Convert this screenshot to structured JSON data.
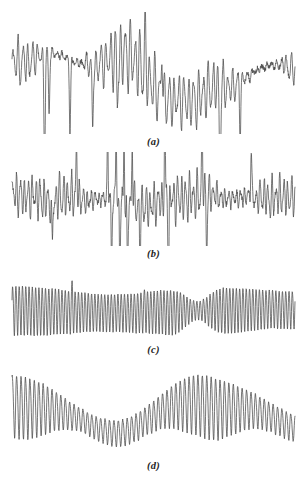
{
  "figure": {
    "kind": "multi-panel-signal-traces",
    "background_color": "#ffffff",
    "trace_color": "#4a4a4a",
    "label_color": "#242424",
    "panel_count": 4
  },
  "panels": [
    {
      "label": "(a)",
      "name": "panel-a",
      "description": "Irregular oscillatory trace with slowly drifting baseline, several deep downward spikes near the left and a high-amplitude burst in the right-of-centre region.",
      "x_range": [
        0,
        1
      ],
      "y_range": [
        -1,
        1
      ],
      "box": {
        "top": 12,
        "height": 122,
        "label_top": 136
      }
    },
    {
      "label": "(b)",
      "name": "panel-b",
      "description": "Dense noisy oscillation with flat baseline and a cluster of very tall narrow spikes near the centre.",
      "x_range": [
        0,
        1
      ],
      "y_range": [
        -1,
        1
      ],
      "box": {
        "top": 152,
        "height": 94,
        "label_top": 248
      }
    },
    {
      "label": "(c)",
      "name": "panel-c",
      "description": "Highly periodic sawtooth-like oscillation of nearly constant frequency with a pronounced amplitude dip in the right-of-centre region.",
      "x_range": [
        0,
        1
      ],
      "y_range": [
        -1,
        1
      ],
      "box": {
        "top": 278,
        "height": 64,
        "label_top": 344
      }
    },
    {
      "label": "(d)",
      "name": "panel-d",
      "description": "Amplitude-modulated oscillation with a smoothly undulating baseline producing two raised lobes and an intervening low-amplitude trough.",
      "x_range": [
        0,
        1
      ],
      "y_range": [
        -1,
        1
      ],
      "box": {
        "top": 372,
        "height": 86,
        "label_top": 460
      }
    }
  ],
  "chart_data": {
    "type": "line",
    "title": "",
    "xlabel": "",
    "ylabel": "",
    "grid": false,
    "legend": "none",
    "axes_visible": false,
    "panel_labels": [
      "(a)",
      "(b)",
      "(c)",
      "(d)"
    ],
    "series": [
      {
        "name": "(a)",
        "n_points": 1100,
        "sampling": "uniform",
        "xlim": [
          0,
          1
        ],
        "ylim": [
          -1,
          1
        ],
        "generator": {
          "baseline": [
            {
              "amp": 0.3,
              "freq": 1.0,
              "phase": 0.55
            },
            {
              "amp": 0.16,
              "freq": 2.3,
              "phase": 2.1
            },
            {
              "amp": 0.09,
              "freq": 3.7,
              "phase": 4.4
            }
          ],
          "envelope": [
            {
              "amp": 0.26,
              "freq": 1.4,
              "phase": 3.3
            },
            {
              "amp": 0.14,
              "freq": 2.9,
              "phase": 0.9
            }
          ],
          "envelope_base": 0.42,
          "carrier": [
            {
              "amp": 1.0,
              "freq": 58.0,
              "phase": 0.0
            },
            {
              "amp": 0.34,
              "freq": 91.0,
              "phase": 1.7
            },
            {
              "amp": 0.2,
              "freq": 37.0,
              "phase": 3.9
            }
          ],
          "noise_amp": 0.11,
          "seed": 20114,
          "spikes": [
            {
              "x": 0.115,
              "depth": -1.55,
              "width": 0.0035
            },
            {
              "x": 0.131,
              "depth": -0.95,
              "width": 0.003
            },
            {
              "x": 0.205,
              "depth": -1.2,
              "width": 0.0032
            },
            {
              "x": 0.285,
              "depth": -1.05,
              "width": 0.003
            },
            {
              "x": 0.372,
              "depth": -0.8,
              "width": 0.0028
            },
            {
              "x": 0.47,
              "depth": 0.7,
              "width": 0.003
            },
            {
              "x": 0.53,
              "depth": 0.78,
              "width": 0.003
            },
            {
              "x": 0.735,
              "depth": -1.35,
              "width": 0.0034
            },
            {
              "x": 0.806,
              "depth": -0.85,
              "width": 0.003
            }
          ]
        }
      },
      {
        "name": "(b)",
        "n_points": 1100,
        "sampling": "uniform",
        "xlim": [
          0,
          1
        ],
        "ylim": [
          -1,
          1
        ],
        "generator": {
          "baseline": [
            {
              "amp": 0.07,
              "freq": 1.2,
              "phase": 1.1
            },
            {
              "amp": 0.05,
              "freq": 2.6,
              "phase": 3.4
            }
          ],
          "envelope": [
            {
              "amp": 0.17,
              "freq": 2.1,
              "phase": 0.4
            },
            {
              "amp": 0.1,
              "freq": 4.3,
              "phase": 2.6
            }
          ],
          "envelope_base": 0.46,
          "carrier": [
            {
              "amp": 1.0,
              "freq": 72.0,
              "phase": 0.6
            },
            {
              "amp": 0.42,
              "freq": 113.0,
              "phase": 2.4
            },
            {
              "amp": 0.24,
              "freq": 45.0,
              "phase": 5.1
            }
          ],
          "noise_amp": 0.17,
          "seed": 77301,
          "spikes": [
            {
              "x": 0.338,
              "depth": 1.55,
              "width": 0.0022
            },
            {
              "x": 0.352,
              "depth": -1.75,
              "width": 0.0022
            },
            {
              "x": 0.368,
              "depth": 1.7,
              "width": 0.0022
            },
            {
              "x": 0.381,
              "depth": -1.65,
              "width": 0.0022
            },
            {
              "x": 0.396,
              "depth": 1.6,
              "width": 0.0022
            },
            {
              "x": 0.408,
              "depth": -1.7,
              "width": 0.0022
            },
            {
              "x": 0.425,
              "depth": 1.45,
              "width": 0.0024
            },
            {
              "x": 0.452,
              "depth": -1.3,
              "width": 0.0024
            },
            {
              "x": 0.54,
              "depth": 1.8,
              "width": 0.0024
            },
            {
              "x": 0.553,
              "depth": -1.85,
              "width": 0.0024
            },
            {
              "x": 0.672,
              "depth": 1.4,
              "width": 0.0026
            },
            {
              "x": 0.688,
              "depth": -1.2,
              "width": 0.0026
            },
            {
              "x": 0.845,
              "depth": 1.15,
              "width": 0.0026
            },
            {
              "x": 0.142,
              "depth": -1.25,
              "width": 0.0026
            },
            {
              "x": 0.228,
              "depth": 1.1,
              "width": 0.0026
            }
          ]
        }
      },
      {
        "name": "(c)",
        "n_points": 1200,
        "sampling": "uniform",
        "xlim": [
          0,
          1
        ],
        "ylim": [
          -1,
          1
        ],
        "generator": {
          "baseline": [
            {
              "amp": 0.05,
              "freq": 1.0,
              "phase": 2.2
            }
          ],
          "envelope": [
            {
              "amp": 0.1,
              "freq": 1.6,
              "phase": 1.2
            }
          ],
          "envelope_base": 0.74,
          "carrier": [
            {
              "amp": 1.0,
              "freq": 86.0,
              "phase": 0.3
            },
            {
              "amp": 0.1,
              "freq": 172.0,
              "phase": 1.6
            }
          ],
          "noise_amp": 0.035,
          "seed": 5512,
          "amplitude_dip": {
            "center": 0.655,
            "width": 0.055,
            "depth": 0.62
          },
          "spikes": [
            {
              "x": 0.213,
              "depth": 0.45,
              "width": 0.0024
            },
            {
              "x": 0.47,
              "depth": 0.22,
              "width": 0.0024
            }
          ]
        }
      },
      {
        "name": "(d)",
        "n_points": 1200,
        "sampling": "uniform",
        "xlim": [
          0,
          1
        ],
        "ylim": [
          -1,
          1
        ],
        "generator": {
          "baseline": [
            {
              "amp": 0.3,
              "freq": 1.45,
              "phase": 1.55
            },
            {
              "amp": 0.1,
              "freq": 2.9,
              "phase": 4.1
            }
          ],
          "envelope": [
            {
              "amp": 0.24,
              "freq": 1.45,
              "phase": 1.55
            },
            {
              "amp": 0.07,
              "freq": 3.1,
              "phase": 0.7
            }
          ],
          "envelope_base": 0.5,
          "carrier": [
            {
              "amp": 1.0,
              "freq": 64.0,
              "phase": 1.1
            },
            {
              "amp": 0.12,
              "freq": 128.0,
              "phase": 2.9
            }
          ],
          "noise_amp": 0.05,
          "seed": 31887,
          "spikes": []
        }
      }
    ]
  }
}
